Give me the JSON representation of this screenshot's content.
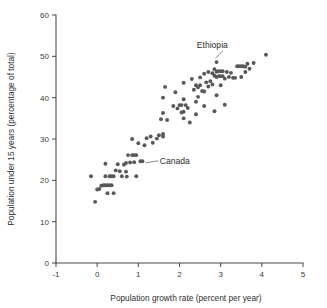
{
  "chart_data": {
    "type": "scatter",
    "title": "",
    "xlabel": "Population growth rate (percent per year)",
    "ylabel": "Population under 15 years (percentage of total)",
    "xlim": [
      -1,
      5
    ],
    "ylim": [
      0,
      60
    ],
    "xticks": [
      -1,
      0,
      1,
      2,
      3,
      4,
      5
    ],
    "yticks": [
      0,
      10,
      20,
      30,
      40,
      50,
      60
    ],
    "xticklabels": [
      "-1",
      "0",
      "1",
      "2",
      "3",
      "4",
      "5"
    ],
    "yticklabels": [
      "0",
      "10",
      "20",
      "30",
      "40",
      "50",
      "60"
    ],
    "grid": false,
    "legend": false,
    "marker_color": "#58585a",
    "marker_size": 3.0,
    "points": [
      [
        -0.15,
        21.0
      ],
      [
        -0.05,
        14.8
      ],
      [
        0.0,
        17.8
      ],
      [
        0.05,
        17.9
      ],
      [
        0.1,
        18.7
      ],
      [
        0.15,
        18.8
      ],
      [
        0.2,
        18.8
      ],
      [
        0.25,
        18.8
      ],
      [
        0.3,
        18.8
      ],
      [
        0.35,
        18.8
      ],
      [
        0.2,
        24.0
      ],
      [
        0.2,
        21.0
      ],
      [
        0.25,
        16.9
      ],
      [
        0.3,
        21.0
      ],
      [
        0.35,
        21.0
      ],
      [
        0.4,
        21.0
      ],
      [
        0.4,
        16.9
      ],
      [
        0.45,
        22.4
      ],
      [
        0.5,
        23.9
      ],
      [
        0.55,
        22.2
      ],
      [
        0.6,
        21.0
      ],
      [
        0.65,
        23.8
      ],
      [
        0.7,
        24.2
      ],
      [
        0.7,
        22.1
      ],
      [
        0.72,
        20.9
      ],
      [
        0.75,
        26.1
      ],
      [
        0.8,
        24.3
      ],
      [
        0.85,
        30.0
      ],
      [
        0.85,
        26.1
      ],
      [
        0.9,
        26.1
      ],
      [
        0.9,
        24.4
      ],
      [
        0.95,
        26.1
      ],
      [
        0.95,
        21.0
      ],
      [
        1.0,
        29.0
      ],
      [
        1.05,
        24.6
      ],
      [
        1.1,
        24.6
      ],
      [
        1.15,
        28.5
      ],
      [
        1.2,
        30.2
      ],
      [
        1.3,
        30.6
      ],
      [
        1.35,
        29.1
      ],
      [
        1.45,
        30.1
      ],
      [
        1.5,
        30.9
      ],
      [
        1.6,
        31.2
      ],
      [
        1.6,
        30.6
      ],
      [
        1.55,
        34.8
      ],
      [
        1.6,
        40.0
      ],
      [
        1.65,
        42.6
      ],
      [
        1.6,
        36.3
      ],
      [
        1.7,
        34.6
      ],
      [
        1.85,
        38.0
      ],
      [
        1.9,
        41.3
      ],
      [
        1.95,
        37.4
      ],
      [
        2.0,
        38.2
      ],
      [
        2.05,
        38.2
      ],
      [
        2.05,
        36.4
      ],
      [
        2.1,
        43.6
      ],
      [
        2.1,
        39.6
      ],
      [
        2.1,
        36.6
      ],
      [
        2.1,
        35.0
      ],
      [
        2.15,
        38.2
      ],
      [
        2.2,
        37.5
      ],
      [
        2.25,
        34.0
      ],
      [
        2.3,
        44.5
      ],
      [
        2.35,
        41.9
      ],
      [
        2.4,
        43.0
      ],
      [
        2.4,
        39.0
      ],
      [
        2.4,
        36.0
      ],
      [
        2.45,
        42.5
      ],
      [
        2.45,
        40.2
      ],
      [
        2.5,
        44.9
      ],
      [
        2.5,
        43.0
      ],
      [
        2.55,
        41.6
      ],
      [
        2.6,
        45.8
      ],
      [
        2.6,
        41.5
      ],
      [
        2.6,
        38.0
      ],
      [
        2.65,
        43.7
      ],
      [
        2.7,
        46.2
      ],
      [
        2.7,
        42.7
      ],
      [
        2.75,
        44.0
      ],
      [
        2.8,
        45.9
      ],
      [
        2.8,
        43.2
      ],
      [
        2.85,
        46.9
      ],
      [
        2.85,
        45.3
      ],
      [
        2.85,
        36.7
      ],
      [
        2.9,
        48.6
      ],
      [
        2.9,
        46.3
      ],
      [
        2.9,
        45.0
      ],
      [
        2.9,
        40.6
      ],
      [
        2.95,
        46.4
      ],
      [
        2.95,
        45.2
      ],
      [
        3.0,
        46.4
      ],
      [
        3.0,
        45.2
      ],
      [
        3.0,
        43.0
      ],
      [
        3.05,
        46.4
      ],
      [
        3.05,
        45.2
      ],
      [
        3.1,
        44.6
      ],
      [
        3.1,
        38.3
      ],
      [
        3.15,
        46.2
      ],
      [
        3.2,
        45.0
      ],
      [
        3.25,
        46.0
      ],
      [
        3.3,
        44.8
      ],
      [
        3.35,
        44.8
      ],
      [
        3.4,
        47.6
      ],
      [
        3.45,
        47.6
      ],
      [
        3.5,
        47.6
      ],
      [
        3.5,
        45.0
      ],
      [
        3.55,
        47.6
      ],
      [
        3.6,
        47.5
      ],
      [
        3.6,
        46.2
      ],
      [
        3.65,
        48.2
      ],
      [
        3.7,
        47.0
      ],
      [
        3.8,
        48.4
      ],
      [
        4.1,
        50.4
      ]
    ],
    "annotations": [
      {
        "label": "Ethiopia",
        "text_x": 2.42,
        "text_y": 51.9,
        "point_x": 2.9,
        "point_y": 48.6
      },
      {
        "label": "Canada",
        "text_x": 1.52,
        "text_y": 24.0,
        "point_x": 1.1,
        "point_y": 24.6
      }
    ]
  }
}
